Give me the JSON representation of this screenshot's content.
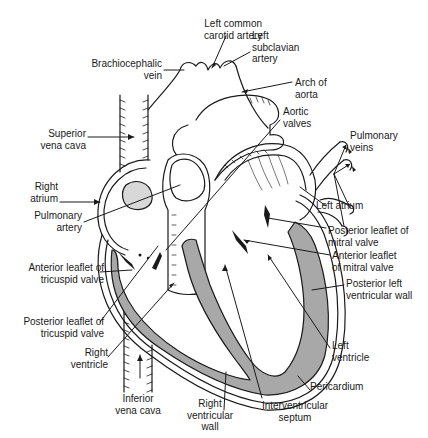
{
  "diagram": {
    "colors": {
      "line": "#1a1a1a",
      "muscle": "#a8a8a8",
      "background": "#ffffff"
    },
    "labels": {
      "left_common_carotid": "Left common\ncarotid artery",
      "left_subclavian": "Left\nsubclavian\nartery",
      "brachiocephalic_vein": "Brachiocephalic\nvein",
      "arch_of_aorta": "Arch of\naorta",
      "aortic_valves": "Aortic\nvalves",
      "superior_vena_cava": "Superior\nvena cava",
      "pulmonary_veins": "Pulmonary\nveins",
      "right_atrium": "Right\natrium",
      "pulmonary_artery": "Pulmonary\nartery",
      "left_atrium": "Left atrium",
      "posterior_leaflet_mitral": "Posterior leaflet of\nmitral valve",
      "anterior_leaflet_mitral": "Anterior leaflet\nof mitral valve",
      "anterior_leaflet_tricuspid": "Anterior leaflet of\ntricuspid valve",
      "posterior_left_ventricular_wall": "Posterior left\nventricular wall",
      "posterior_leaflet_tricuspid": "Posterior leaflet of\ntricuspid valve",
      "right_ventricle": "Right\nventricle",
      "left_ventricle": "Left\nventricle",
      "pericardium": "Pericardium",
      "inferior_vena_cava": "Inferior\nvena cava",
      "right_ventricular_wall": "Right\nventricular\nwall",
      "interventricular_septum": "Interventricular\nseptum"
    }
  }
}
